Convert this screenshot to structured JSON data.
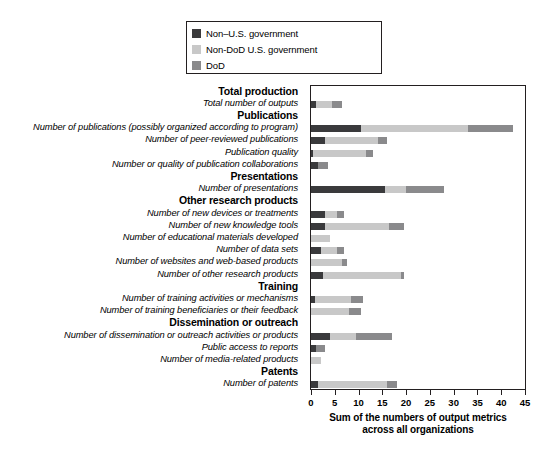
{
  "legend": {
    "items": [
      {
        "label": "Non–U.S. government",
        "color": "#3a3a3c",
        "name": "legend-non-us-government"
      },
      {
        "label": "Non-DoD U.S. government",
        "color": "#c8c8c8",
        "name": "legend-non-dod-us-government"
      },
      {
        "label": "DoD",
        "color": "#8a8a8c",
        "name": "legend-dod"
      }
    ]
  },
  "axis": {
    "title_line1": "Sum of the numbers of output metrics",
    "title_line2": "across all organizations",
    "ticks": [
      "0",
      "5",
      "10",
      "15",
      "20",
      "25",
      "30",
      "35",
      "40",
      "45"
    ]
  },
  "chart_data": {
    "type": "bar",
    "orientation": "horizontal",
    "stacked": true,
    "title": "",
    "xlabel": "Sum of the numbers of output metrics across all organizations",
    "ylabel": "",
    "xlim": [
      0,
      45
    ],
    "xticks": [
      0,
      5,
      10,
      15,
      20,
      25,
      30,
      35,
      40,
      45
    ],
    "grid": false,
    "legend_position": "top-right",
    "series": [
      {
        "name": "Non–U.S. government",
        "color": "#3a3a3c"
      },
      {
        "name": "Non-DoD U.S. government",
        "color": "#c8c8c8"
      },
      {
        "name": "DoD",
        "color": "#8a8a8c"
      }
    ],
    "rows": [
      {
        "label": "Total production",
        "type": "group"
      },
      {
        "label": "Total number of outputs",
        "type": "item",
        "values": [
          1.0,
          3.5,
          2.0
        ],
        "total": 6.5
      },
      {
        "label": "Publications",
        "type": "group"
      },
      {
        "label": "Number of publications (possibly organized according to program)",
        "type": "item",
        "values": [
          10.5,
          22.5,
          9.5
        ],
        "total": 42.5
      },
      {
        "label": "Number of peer-reviewed publications",
        "type": "item",
        "values": [
          3.0,
          11.0,
          2.0
        ],
        "total": 16.0
      },
      {
        "label": "Publication quality",
        "type": "item",
        "values": [
          0.5,
          11.0,
          1.5
        ],
        "total": 13.0
      },
      {
        "label": "Number or quality of publication collaborations",
        "type": "item",
        "values": [
          1.5,
          0.0,
          2.0
        ],
        "total": 3.5
      },
      {
        "label": "Presentations",
        "type": "group"
      },
      {
        "label": "Number of presentations",
        "type": "item",
        "values": [
          15.5,
          4.5,
          8.0
        ],
        "total": 28.0
      },
      {
        "label": "Other research products",
        "type": "group"
      },
      {
        "label": "Number of new devices or treatments",
        "type": "item",
        "values": [
          3.0,
          2.5,
          1.5
        ],
        "total": 7.0
      },
      {
        "label": "Number of new knowledge tools",
        "type": "item",
        "values": [
          3.0,
          13.5,
          3.0
        ],
        "total": 19.5
      },
      {
        "label": "Number of educational materials developed",
        "type": "item",
        "values": [
          0.0,
          4.0,
          0.0
        ],
        "total": 4.0
      },
      {
        "label": "Number of data sets",
        "type": "item",
        "values": [
          2.0,
          3.5,
          1.5
        ],
        "total": 7.0
      },
      {
        "label": "Number of websites and web-based products",
        "type": "item",
        "values": [
          0.0,
          6.5,
          1.0
        ],
        "total": 7.5
      },
      {
        "label": "Number of other research products",
        "type": "item",
        "values": [
          2.5,
          16.5,
          0.5
        ],
        "total": 19.5
      },
      {
        "label": "Training",
        "type": "group"
      },
      {
        "label": "Number of training activities or mechanisms",
        "type": "item",
        "values": [
          0.8,
          7.7,
          2.5
        ],
        "total": 11.0
      },
      {
        "label": "Number of training beneficiaries or their feedback",
        "type": "item",
        "values": [
          0.0,
          8.0,
          2.5
        ],
        "total": 10.5
      },
      {
        "label": "Dissemination or outreach",
        "type": "group"
      },
      {
        "label": "Number of dissemination or outreach activities or products",
        "type": "item",
        "values": [
          4.0,
          5.5,
          7.5
        ],
        "total": 17.0
      },
      {
        "label": "Public access to reports",
        "type": "item",
        "values": [
          1.0,
          0.0,
          2.0
        ],
        "total": 3.0
      },
      {
        "label": "Number of media-related products",
        "type": "item",
        "values": [
          0.0,
          2.0,
          0.0
        ],
        "total": 2.0
      },
      {
        "label": "Patents",
        "type": "group"
      },
      {
        "label": "Number of patents",
        "type": "item",
        "values": [
          1.5,
          14.5,
          2.0
        ],
        "total": 18.0
      }
    ]
  }
}
